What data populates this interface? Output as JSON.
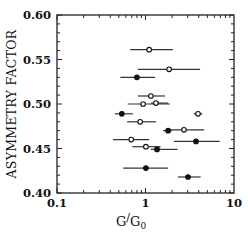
{
  "chart_data": {
    "type": "scatter",
    "title": "",
    "xlabel": "G/G0",
    "xlabel_main": "G",
    "xlabel_denom": "G",
    "xlabel_sub": "0",
    "ylabel": "ASYMMETRY FACTOR",
    "xscale": "log",
    "xlim": [
      0.1,
      10
    ],
    "ylim": [
      0.4,
      0.6
    ],
    "x_ticks": [
      0.1,
      1,
      10
    ],
    "x_tick_labels": [
      "0.1",
      "1",
      "10"
    ],
    "y_ticks": [
      0.4,
      0.45,
      0.5,
      0.55,
      0.6
    ],
    "y_tick_labels": [
      "0.40",
      "0.45",
      "0.50",
      "0.55",
      "0.60"
    ],
    "grid": false,
    "legend": null,
    "error_bars": "horizontal",
    "series": [
      {
        "name": "open markers",
        "marker": "open-circle",
        "points": [
          {
            "x": 1.1,
            "y": 0.561,
            "xerr_low": 0.67,
            "xerr_high": 2.04
          },
          {
            "x": 1.85,
            "y": 0.539,
            "xerr_low": 0.82,
            "xerr_high": 4.14
          },
          {
            "x": 1.15,
            "y": 0.509,
            "xerr_low": 0.82,
            "xerr_high": 1.66
          },
          {
            "x": 0.94,
            "y": 0.5,
            "xerr_low": 0.63,
            "xerr_high": 1.89
          },
          {
            "x": 1.31,
            "y": 0.501,
            "xerr_low": 1.15,
            "xerr_high": 1.8
          },
          {
            "x": 3.92,
            "y": 0.489,
            "xerr_low": 3.5,
            "xerr_high": 4.4
          },
          {
            "x": 0.87,
            "y": 0.48,
            "xerr_low": 0.62,
            "xerr_high": 1.31
          },
          {
            "x": 2.72,
            "y": 0.471,
            "xerr_low": 1.8,
            "xerr_high": 4.6
          },
          {
            "x": 0.69,
            "y": 0.46,
            "xerr_low": 0.43,
            "xerr_high": 1.1
          },
          {
            "x": 1.01,
            "y": 0.452,
            "xerr_low": 0.71,
            "xerr_high": 1.48
          }
        ]
      },
      {
        "name": "filled markers",
        "marker": "filled-circle",
        "points": [
          {
            "x": 0.8,
            "y": 0.53,
            "xerr_low": 0.52,
            "xerr_high": 1.28
          },
          {
            "x": 0.54,
            "y": 0.489,
            "xerr_low": 0.45,
            "xerr_high": 0.72
          },
          {
            "x": 1.8,
            "y": 0.47,
            "xerr_low": 1.58,
            "xerr_high": 1.98
          },
          {
            "x": 3.72,
            "y": 0.458,
            "xerr_low": 2.09,
            "xerr_high": 6.9
          },
          {
            "x": 1.35,
            "y": 0.449,
            "xerr_low": 1.15,
            "xerr_high": 2.3
          },
          {
            "x": 1.01,
            "y": 0.428,
            "xerr_low": 0.56,
            "xerr_high": 1.8
          },
          {
            "x": 3.02,
            "y": 0.418,
            "xerr_low": 2.33,
            "xerr_high": 4.2
          }
        ]
      }
    ]
  }
}
